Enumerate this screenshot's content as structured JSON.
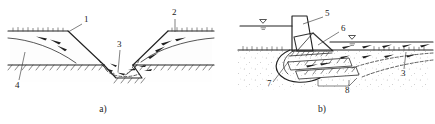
{
  "figure": {
    "width": 435,
    "height": 124,
    "background_color": "#ffffff",
    "line_color": "#2b2b2b",
    "panels": [
      {
        "id": "a",
        "caption": "a)",
        "name": "canal-embankment-failure",
        "description": "Excavated canal / trench section through an embankment showing seepage flow into the cut and sliding of both side slopes",
        "callouts": [
          {
            "label": "1",
            "name": "callout-1",
            "x": 84,
            "y": 22,
            "target_x": 70,
            "target_y": 31
          },
          {
            "label": "2",
            "name": "callout-2",
            "x": 175,
            "y": 15,
            "target_x": 174,
            "target_y": 31
          },
          {
            "label": "3",
            "name": "callout-3",
            "x": 119,
            "y": 47,
            "target_x": 117,
            "target_y": 70
          },
          {
            "label": "4",
            "name": "callout-4",
            "x": 16,
            "y": 84,
            "target_x": 25,
            "target_y": 52
          }
        ]
      },
      {
        "id": "b",
        "caption": "b)",
        "name": "retaining-wall-slip-circle-failure",
        "description": "Gravity retaining wall with water on both sides, circular slip surface and active failure wedges beneath the base",
        "callouts": [
          {
            "label": "5",
            "name": "callout-5",
            "x": 326,
            "y": 15,
            "target_x": 306,
            "target_y": 24
          },
          {
            "label": "6",
            "name": "callout-6",
            "x": 342,
            "y": 30,
            "target_x": 320,
            "target_y": 44
          },
          {
            "label": "3",
            "name": "callout-3-b",
            "x": 403,
            "y": 73,
            "target_x": 406,
            "target_y": 52
          },
          {
            "label": "7",
            "name": "callout-7",
            "x": 269,
            "y": 84,
            "target_x": 288,
            "target_y": 62
          },
          {
            "label": "8",
            "name": "callout-8",
            "x": 347,
            "y": 90,
            "target_x": 352,
            "target_y": 76
          }
        ]
      }
    ],
    "symbols": {
      "water_table": "water-table-triangle",
      "ground_surface": "hatched-ground-line",
      "flow_arrow": "seepage-flow-arrow",
      "vegetation": "grass-tick-marks",
      "wall_hatch": "diagonal-hatch-concrete"
    }
  }
}
